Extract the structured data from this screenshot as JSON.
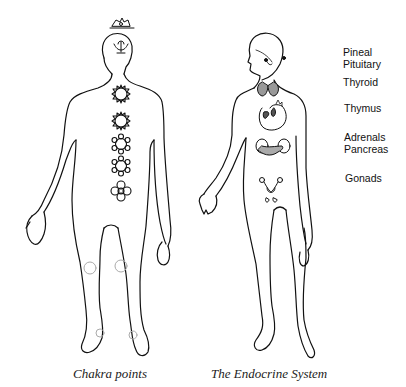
{
  "figure": {
    "left_panel": {
      "caption": "Chakra points",
      "chakras": [
        {
          "name": "crown",
          "symbol": "lotus"
        },
        {
          "name": "third-eye",
          "symbol": "winged-seed"
        },
        {
          "name": "throat",
          "symbol": "sun-star"
        },
        {
          "name": "heart",
          "symbol": "sun-star"
        },
        {
          "name": "solar-plexus",
          "symbol": "flower"
        },
        {
          "name": "sacral",
          "symbol": "flower"
        },
        {
          "name": "root",
          "symbol": "four-petal"
        }
      ],
      "minor_points": [
        "left-knee",
        "right-knee",
        "left-ankle",
        "right-ankle"
      ]
    },
    "right_panel": {
      "caption": "The Endocrine System",
      "glands": [
        {
          "label": "Pineal",
          "y": 52
        },
        {
          "label": "Pituitary",
          "y": 64
        },
        {
          "label": "Thyroid",
          "y": 82
        },
        {
          "label": "Thymus",
          "y": 108
        },
        {
          "label": "Adrenals",
          "y": 137
        },
        {
          "label": "Pancreas",
          "y": 149
        },
        {
          "label": "Gonads",
          "y": 177
        }
      ]
    },
    "colors": {
      "line": "#111111",
      "text": "#111111",
      "minor_point": "#aaaaaa",
      "background": "#ffffff"
    }
  }
}
